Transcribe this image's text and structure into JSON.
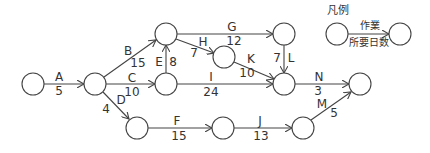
{
  "legend": {
    "title": "凡例",
    "activity_label": "作業",
    "duration_label": "所要日数"
  },
  "nodes": [
    {
      "id": "n1",
      "x": 33,
      "y": 84
    },
    {
      "id": "n2",
      "x": 95,
      "y": 84
    },
    {
      "id": "n3",
      "x": 166,
      "y": 34
    },
    {
      "id": "n4",
      "x": 166,
      "y": 84
    },
    {
      "id": "n5",
      "x": 224,
      "y": 57
    },
    {
      "id": "n6",
      "x": 284,
      "y": 34
    },
    {
      "id": "n7",
      "x": 284,
      "y": 84
    },
    {
      "id": "n8",
      "x": 360,
      "y": 84
    },
    {
      "id": "n9",
      "x": 137,
      "y": 128
    },
    {
      "id": "n10",
      "x": 223,
      "y": 128
    },
    {
      "id": "n11",
      "x": 303,
      "y": 128
    }
  ],
  "activities": [
    {
      "name": "A",
      "duration": "5",
      "from": "n1",
      "to": "n2"
    },
    {
      "name": "B",
      "duration": "15",
      "from": "n2",
      "to": "n3"
    },
    {
      "name": "C",
      "duration": "10",
      "from": "n2",
      "to": "n4"
    },
    {
      "name": "D",
      "duration": "4",
      "from": "n2",
      "to": "n9"
    },
    {
      "name": "E",
      "duration": "8",
      "from": "n4",
      "to": "n3"
    },
    {
      "name": "F",
      "duration": "15",
      "from": "n9",
      "to": "n10"
    },
    {
      "name": "G",
      "duration": "12",
      "from": "n3",
      "to": "n6"
    },
    {
      "name": "H",
      "duration": "7",
      "from": "n3",
      "to": "n5"
    },
    {
      "name": "I",
      "duration": "24",
      "from": "n4",
      "to": "n7"
    },
    {
      "name": "J",
      "duration": "13",
      "from": "n10",
      "to": "n11"
    },
    {
      "name": "K",
      "duration": "10",
      "from": "n5",
      "to": "n7"
    },
    {
      "name": "L",
      "duration": "7",
      "from": "n6",
      "to": "n7"
    },
    {
      "name": "M",
      "duration": "5",
      "from": "n11",
      "to": "n8"
    },
    {
      "name": "N",
      "duration": "3",
      "from": "n7",
      "to": "n8"
    }
  ]
}
